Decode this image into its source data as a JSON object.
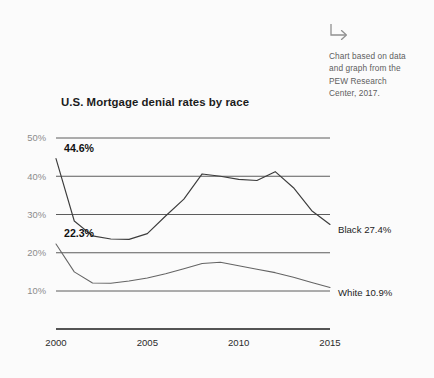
{
  "annotation": {
    "icon": "arrow-down-right-icon",
    "text": "Chart based on data\nand graph from the\nPEW Research\nCenter, 2017."
  },
  "chart_data": {
    "type": "line",
    "title": "U.S. Mortgage denial rates by race",
    "xlabel": "",
    "ylabel": "",
    "xlim": [
      2000,
      2015
    ],
    "ylim": [
      0,
      50
    ],
    "grid": true,
    "grid_axis": "y",
    "legend_position": "right-inline",
    "x_ticks": [
      2000,
      2005,
      2010,
      2015
    ],
    "x_tick_labels": [
      "2000",
      "2005",
      "2010",
      "2015"
    ],
    "y_ticks": [
      10,
      20,
      30,
      40,
      50
    ],
    "y_tick_labels": [
      "10%",
      "20%",
      "30%",
      "40%",
      "50%"
    ],
    "x": [
      2000,
      2001,
      2002,
      2003,
      2004,
      2005,
      2006,
      2007,
      2008,
      2009,
      2010,
      2011,
      2012,
      2013,
      2014,
      2015
    ],
    "series": [
      {
        "name": "Black",
        "end_label": "Black 27.4%",
        "start_label": "44.6%",
        "color": "#3c3c3c",
        "values": [
          44.6,
          28.3,
          24.4,
          23.6,
          23.5,
          25.0,
          29.6,
          34.0,
          40.6,
          40.0,
          39.2,
          38.9,
          41.2,
          37.0,
          31.0,
          27.4
        ]
      },
      {
        "name": "White",
        "end_label": "White 10.9%",
        "start_label": "22.3%",
        "color": "#646464",
        "values": [
          22.3,
          15.0,
          12.1,
          12.0,
          12.6,
          13.4,
          14.5,
          15.8,
          17.2,
          17.5,
          16.6,
          15.7,
          14.8,
          13.6,
          12.2,
          10.9
        ]
      }
    ],
    "point_labels": [
      {
        "series": "Black",
        "x": 2000,
        "value": 44.6,
        "text": "44.6%"
      },
      {
        "series": "White",
        "x": 2000,
        "value": 22.3,
        "text": "22.3%"
      }
    ]
  }
}
